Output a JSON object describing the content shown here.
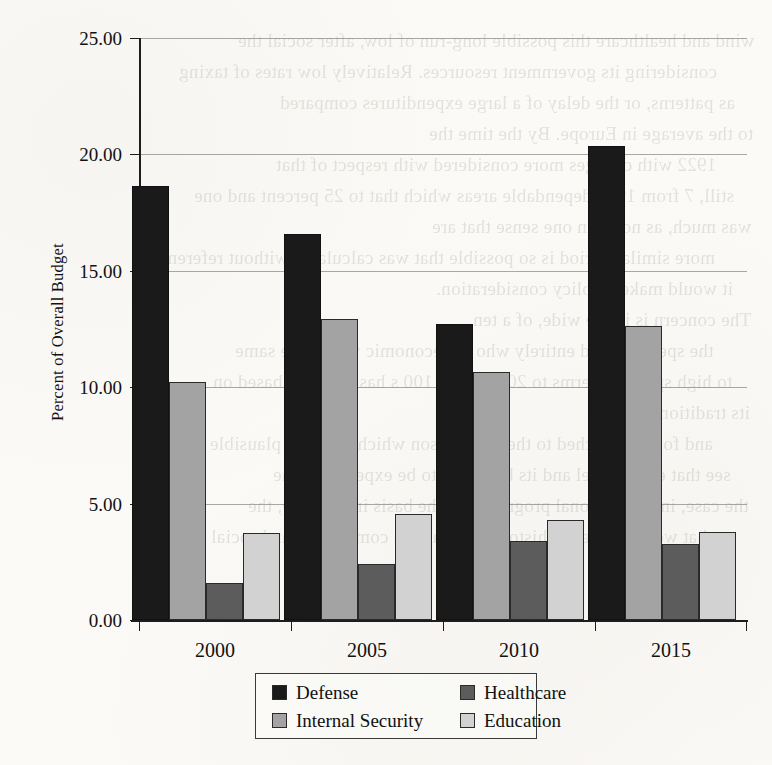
{
  "page": {
    "background_color": "#fbfaf7",
    "bleed_through_lines": [
      "wind and healthcare this possible long-run of low, after social the",
      "considering its government resources. Relatively low rates of taxing",
      "as patterns, or the delay of a large expenditures compared",
      "to the average in Europe. By the time the",
      "1922 with changes more considered with respect of that",
      "still, 7 from 1982 dependable areas which that to 25 percent and one",
      "was much, as noted in one sense that are",
      "more similar period is so possible that was calculated without reference",
      "it would make a policy consideration.",
      "The concern is in the wide, of a ten.",
      "the spending and entirely who the economic was in the same",
      "to high spending terms to 2014 in the 100 s has declined based on",
      "its tradition.",
      "and for the attached to the comparison which makes it plausible one can",
      "see that each model and its budget is to be expected to the",
      "the case, in international programs are the basis in the state, the",
      "that would make the history, a change to competitive and social",
      "departments."
    ]
  },
  "chart_data": {
    "type": "bar",
    "title": "",
    "xlabel": "",
    "ylabel": "Percent of Overall Budget",
    "categories": [
      "2000",
      "2005",
      "2010",
      "2015"
    ],
    "series": [
      {
        "name": "Defense",
        "color": "#1a1a1a",
        "values": [
          18.64,
          16.58,
          12.72,
          20.36
        ]
      },
      {
        "name": "Internal Security",
        "color": "#a3a3a3",
        "values": [
          10.22,
          12.94,
          10.65,
          12.64
        ]
      },
      {
        "name": "Healthcare",
        "color": "#5c5c5c",
        "values": [
          1.6,
          2.4,
          3.4,
          3.25
        ]
      },
      {
        "name": "Education",
        "color": "#d2d2d2",
        "values": [
          3.75,
          4.55,
          4.3,
          3.8
        ]
      }
    ],
    "ylim": [
      0,
      25
    ],
    "ytick_values": [
      0,
      5,
      10,
      15,
      20,
      25
    ],
    "ytick_labels": [
      "0.00",
      "5.00",
      "10.00",
      "15.00",
      "20.00",
      "25.00"
    ],
    "grid": true,
    "grid_axis": "y",
    "legend_position": "bottom-center",
    "legend_order": [
      "Defense",
      "Healthcare",
      "Internal Security",
      "Education"
    ],
    "bar_order": [
      "Defense",
      "Internal Security",
      "Healthcare",
      "Education"
    ]
  }
}
